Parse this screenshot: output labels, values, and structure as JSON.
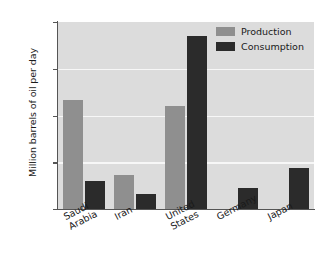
{
  "chart_data": {
    "type": "bar",
    "title": "",
    "xlabel": "",
    "ylabel": "Million barrels of oil per day",
    "categories": [
      "Saudi Arabia",
      "Iran",
      "United States",
      "Germany",
      "Japan"
    ],
    "category_lines": [
      [
        "Saudi",
        "Arabia"
      ],
      [
        "Iran"
      ],
      [
        "United",
        "States"
      ],
      [
        "Germany"
      ],
      [
        "Japan"
      ]
    ],
    "series": [
      {
        "name": "Production",
        "color": "#8f8f8f",
        "values": [
          11.7,
          3.6,
          11.0,
          0.05,
          0.05
        ]
      },
      {
        "name": "Consumption",
        "color": "#2b2b2b",
        "values": [
          3.0,
          1.6,
          18.5,
          2.2,
          4.4
        ]
      }
    ],
    "ylim": [
      0,
      20
    ],
    "yticks": [
      0,
      5,
      10,
      15,
      20
    ],
    "ytick_labels": [
      "0",
      "5",
      "10",
      "15",
      "20"
    ],
    "grid": "horizontal",
    "legend_position": "top-right",
    "plot_background": "#dcdcdc",
    "gridline_color": "#f7f7f7",
    "axis_color": "#555555"
  }
}
